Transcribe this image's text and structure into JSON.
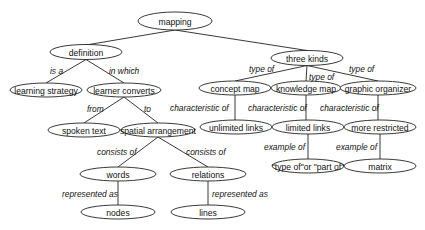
{
  "diagram": {
    "type": "concept-map",
    "nodes": [
      {
        "id": "mapping",
        "label": "mapping",
        "cx": 175,
        "cy": 21,
        "rx": 37,
        "ry": 9
      },
      {
        "id": "definition",
        "label": "definition",
        "cx": 86,
        "cy": 52,
        "rx": 36,
        "ry": 7.5
      },
      {
        "id": "learning_strategy",
        "label": "learning strategy",
        "cx": 46,
        "cy": 90,
        "rx": 36,
        "ry": 7
      },
      {
        "id": "learner_converts",
        "label": "learner converts",
        "cx": 124,
        "cy": 90,
        "rx": 37,
        "ry": 7
      },
      {
        "id": "spoken_text",
        "label": "spoken text",
        "cx": 84,
        "cy": 130,
        "rx": 36,
        "ry": 7
      },
      {
        "id": "spatial_arrangement",
        "label": "spatial arrangement",
        "cx": 158,
        "cy": 130,
        "rx": 37,
        "ry": 7
      },
      {
        "id": "words",
        "label": "words",
        "cx": 118,
        "cy": 174,
        "rx": 38,
        "ry": 7
      },
      {
        "id": "relations",
        "label": "relations",
        "cx": 208,
        "cy": 174,
        "rx": 38,
        "ry": 7
      },
      {
        "id": "nodes",
        "label": "nodes",
        "cx": 118,
        "cy": 212,
        "rx": 37,
        "ry": 7
      },
      {
        "id": "lines",
        "label": "lines",
        "cx": 208,
        "cy": 212,
        "rx": 37,
        "ry": 7
      },
      {
        "id": "three_kinds",
        "label": "three kinds",
        "cx": 307,
        "cy": 58,
        "rx": 36,
        "ry": 7.5
      },
      {
        "id": "concept_map",
        "label": "concept map",
        "cx": 235,
        "cy": 88,
        "rx": 36,
        "ry": 7
      },
      {
        "id": "knowledge_map",
        "label": "knowledge map",
        "cx": 306,
        "cy": 88,
        "rx": 35,
        "ry": 7
      },
      {
        "id": "graphic_organizer",
        "label": "graphic organizer",
        "cx": 378,
        "cy": 88,
        "rx": 38,
        "ry": 7
      },
      {
        "id": "unlimited_links",
        "label": "unlimited links",
        "cx": 236,
        "cy": 127,
        "rx": 36,
        "ry": 7
      },
      {
        "id": "limited_links",
        "label": "limited links",
        "cx": 308,
        "cy": 127,
        "rx": 36,
        "ry": 7
      },
      {
        "id": "more_restricted",
        "label": "more restricted",
        "cx": 380,
        "cy": 127,
        "rx": 36,
        "ry": 7
      },
      {
        "id": "type_or_part",
        "label": "\"type of\"or \"part of\"",
        "cx": 308,
        "cy": 166,
        "rx": 36,
        "ry": 7
      },
      {
        "id": "matrix",
        "label": "matrix",
        "cx": 380,
        "cy": 166,
        "rx": 36,
        "ry": 7
      }
    ],
    "edges": [
      {
        "from": "mapping",
        "to": "definition",
        "label": "",
        "x1": 175,
        "y1": 30,
        "x2": 86,
        "y2": 45
      },
      {
        "from": "mapping",
        "to": "three_kinds",
        "label": "",
        "x1": 175,
        "y1": 30,
        "x2": 307,
        "y2": 50.5
      },
      {
        "from": "definition",
        "to": "learning_strategy",
        "label": "is a",
        "x1": 86,
        "y1": 59.5,
        "x2": 46,
        "y2": 83,
        "lx": 50,
        "ly": 71
      },
      {
        "from": "definition",
        "to": "learner_converts",
        "label": "in which",
        "x1": 86,
        "y1": 59.5,
        "x2": 124,
        "y2": 83,
        "lx": 109,
        "ly": 71
      },
      {
        "from": "learner_converts",
        "to": "spoken_text",
        "label": "from",
        "x1": 124,
        "y1": 97,
        "x2": 84,
        "y2": 123,
        "lx": 87,
        "ly": 109
      },
      {
        "from": "learner_converts",
        "to": "spatial_arrangement",
        "label": "to",
        "x1": 124,
        "y1": 97,
        "x2": 158,
        "y2": 123,
        "lx": 144,
        "ly": 109
      },
      {
        "from": "spatial_arrangement",
        "to": "words",
        "label": "consists of",
        "x1": 158,
        "y1": 137,
        "x2": 118,
        "y2": 167,
        "lx": 97,
        "ly": 152
      },
      {
        "from": "spatial_arrangement",
        "to": "relations",
        "label": "consists of",
        "x1": 158,
        "y1": 137,
        "x2": 208,
        "y2": 167,
        "lx": 186,
        "ly": 152
      },
      {
        "from": "words",
        "to": "nodes",
        "label": "represented as",
        "x1": 118,
        "y1": 181,
        "x2": 118,
        "y2": 205,
        "lx": 62,
        "ly": 194
      },
      {
        "from": "relations",
        "to": "lines",
        "label": "represented as",
        "x1": 208,
        "y1": 181,
        "x2": 208,
        "y2": 205,
        "lx": 212,
        "ly": 194
      },
      {
        "from": "three_kinds",
        "to": "concept_map",
        "label": "type of",
        "x1": 307,
        "y1": 65.5,
        "x2": 235,
        "y2": 81,
        "lx": 249,
        "ly": 69
      },
      {
        "from": "three_kinds",
        "to": "knowledge_map",
        "label": "type of",
        "x1": 307,
        "y1": 65.5,
        "x2": 306,
        "y2": 81,
        "lx": 309,
        "ly": 77
      },
      {
        "from": "three_kinds",
        "to": "graphic_organizer",
        "label": "type of",
        "x1": 307,
        "y1": 65.5,
        "x2": 378,
        "y2": 81,
        "lx": 349,
        "ly": 69
      },
      {
        "from": "concept_map",
        "to": "unlimited_links",
        "label": "characteristic of",
        "x1": 235,
        "y1": 95,
        "x2": 235,
        "y2": 120,
        "lx": 170,
        "ly": 108
      },
      {
        "from": "knowledge_map",
        "to": "limited_links",
        "label": "characteristic of",
        "x1": 306,
        "y1": 95,
        "x2": 306,
        "y2": 120,
        "lx": 248,
        "ly": 108
      },
      {
        "from": "graphic_organizer",
        "to": "more_restricted",
        "label": "characteristic of",
        "x1": 378,
        "y1": 95,
        "x2": 378,
        "y2": 120,
        "lx": 320,
        "ly": 108
      },
      {
        "from": "limited_links",
        "to": "type_or_part",
        "label": "example of",
        "x1": 308,
        "y1": 134,
        "x2": 308,
        "y2": 159,
        "lx": 264,
        "ly": 147
      },
      {
        "from": "more_restricted",
        "to": "matrix",
        "label": "example of",
        "x1": 380,
        "y1": 134,
        "x2": 380,
        "y2": 159,
        "lx": 336,
        "ly": 147
      }
    ]
  },
  "colors": {
    "background": "#ffffff",
    "stroke": "#222222",
    "text": "#111111"
  }
}
